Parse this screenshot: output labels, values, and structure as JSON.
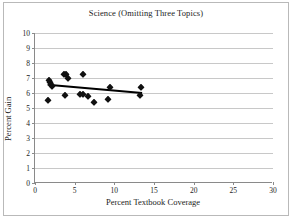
{
  "chart_data": {
    "type": "scatter",
    "title": "Science (Omitting Three Topics)",
    "xlabel": "Percent Textbook Coverage",
    "ylabel": "Percent Gain",
    "xlim": [
      0,
      30
    ],
    "ylim": [
      0,
      10
    ],
    "xticks": [
      0,
      5,
      10,
      15,
      20,
      25,
      30
    ],
    "yticks": [
      0,
      1,
      2,
      3,
      4,
      5,
      6,
      7,
      8,
      9,
      10
    ],
    "grid": "horizontal",
    "legend": "none",
    "marker": "filled-diamond",
    "marker_color": "#111111",
    "points": [
      {
        "x": 1.7,
        "y": 5.55
      },
      {
        "x": 1.8,
        "y": 6.9
      },
      {
        "x": 1.9,
        "y": 6.75
      },
      {
        "x": 2.0,
        "y": 6.6
      },
      {
        "x": 2.1,
        "y": 6.5
      },
      {
        "x": 3.6,
        "y": 7.3
      },
      {
        "x": 3.8,
        "y": 5.9
      },
      {
        "x": 3.9,
        "y": 7.25
      },
      {
        "x": 4.1,
        "y": 7.0
      },
      {
        "x": 5.7,
        "y": 5.95
      },
      {
        "x": 6.0,
        "y": 7.3
      },
      {
        "x": 6.1,
        "y": 5.95
      },
      {
        "x": 6.7,
        "y": 5.8
      },
      {
        "x": 7.4,
        "y": 5.4
      },
      {
        "x": 9.2,
        "y": 5.6
      },
      {
        "x": 9.4,
        "y": 6.4
      },
      {
        "x": 13.2,
        "y": 5.9
      },
      {
        "x": 13.4,
        "y": 6.4
      }
    ],
    "trendline": {
      "type": "linear-fit",
      "color": "#000000",
      "x_start": 1.6,
      "y_start": 6.55,
      "x_end": 13.5,
      "y_end": 6.0
    }
  }
}
